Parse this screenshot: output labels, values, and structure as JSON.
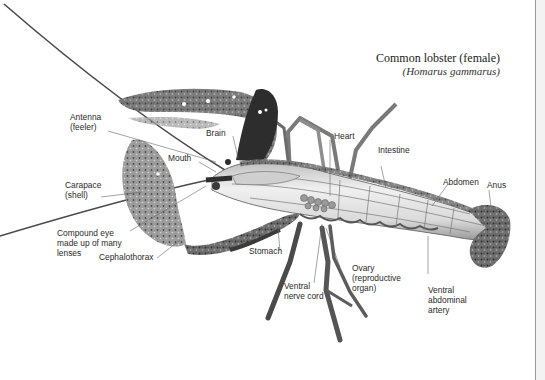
{
  "title": {
    "main": "Common lobster (female)",
    "scientific": "(Homarus gammarus)"
  },
  "labels": {
    "antenna": [
      "Antenna",
      "(feeler)"
    ],
    "brain": [
      "Brain"
    ],
    "mouth": [
      "Mouth"
    ],
    "heart": [
      "Heart"
    ],
    "intestine": [
      "Intestine"
    ],
    "abdomen": [
      "Abdomen"
    ],
    "anus": [
      "Anus"
    ],
    "carapace": [
      "Carapace",
      "(shell)"
    ],
    "compound_eye": [
      "Compound eye",
      "made up of many",
      "lenses"
    ],
    "cephalothorax": [
      "Cephalothorax"
    ],
    "stomach": [
      "Stomach"
    ],
    "ventral_nerve_cord": [
      "Ventral",
      "nerve cord"
    ],
    "ovary": [
      "Ovary",
      "(reproductive",
      "organ)"
    ],
    "ventral_abdominal_artery": [
      "Ventral",
      "abdominal",
      "artery"
    ]
  },
  "colors": {
    "background": "#ffffff",
    "side_panel": "#f3f3f3",
    "leader_line": "#666666",
    "shell_dark": "#3a3a3a",
    "shell_mid": "#8a8a8a",
    "body_light": "#e6e6e6"
  }
}
